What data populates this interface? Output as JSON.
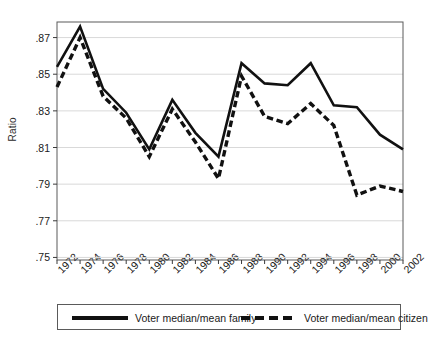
{
  "chart_data": {
    "type": "line",
    "title": "",
    "xlabel": "",
    "ylabel": "Ratio",
    "grid": true,
    "legend_position": "bottom",
    "xlim": [
      1972,
      2002
    ],
    "ylim": [
      0.75,
      0.878
    ],
    "ytick_labels": [
      ".87",
      ".85",
      ".83",
      ".81",
      ".79",
      ".77",
      ".75"
    ],
    "ytick_values": [
      0.87,
      0.85,
      0.83,
      0.81,
      0.79,
      0.77,
      0.75
    ],
    "x": [
      1972,
      1974,
      1976,
      1978,
      1980,
      1982,
      1984,
      1986,
      1988,
      1990,
      1992,
      1994,
      1996,
      1998,
      2000,
      2002
    ],
    "xtick_labels": [
      "1972",
      "1974",
      "1976",
      "1978",
      "1980",
      "1982",
      "1984",
      "1986",
      "1988",
      "1990",
      "1992",
      "1994",
      "1996",
      "1998",
      "2000",
      "2002"
    ],
    "series": [
      {
        "name": "Voter median/mean family",
        "style": "solid",
        "color": "#111111",
        "values": [
          0.854,
          0.876,
          0.842,
          0.829,
          0.809,
          0.836,
          0.818,
          0.805,
          0.856,
          0.845,
          0.844,
          0.856,
          0.833,
          0.832,
          0.817,
          0.809
        ]
      },
      {
        "name": "Voter median/mean citizen",
        "style": "dashed",
        "color": "#111111",
        "values": [
          0.843,
          0.87,
          0.838,
          0.826,
          0.805,
          0.831,
          0.813,
          0.793,
          0.849,
          0.827,
          0.823,
          0.834,
          0.822,
          0.784,
          0.789,
          0.786
        ]
      }
    ]
  },
  "legend": {
    "entries": [
      {
        "label": "Voter median/mean family"
      },
      {
        "label": "Voter median/mean citizen"
      }
    ]
  },
  "axes": {
    "y_title": "Ratio"
  }
}
